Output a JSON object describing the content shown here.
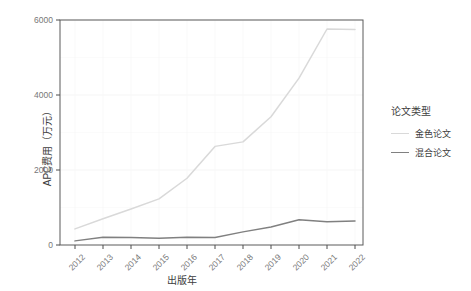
{
  "chart_data": {
    "type": "line",
    "title": "",
    "xlabel": "出版年",
    "ylabel": "APC费用（万元）",
    "x": [
      2012,
      2013,
      2014,
      2015,
      2016,
      2017,
      2018,
      2019,
      2020,
      2021,
      2022
    ],
    "xticklabels": [
      "2012",
      "2013",
      "2014",
      "2015",
      "2016",
      "2017",
      "2018",
      "2019",
      "2020",
      "2021",
      "2022"
    ],
    "yticklabels": [
      "0",
      "2000",
      "4000",
      "6000"
    ],
    "yticks": [
      0,
      2000,
      4000,
      6000
    ],
    "ylim": [
      0,
      6000
    ],
    "xlim": [
      2012,
      2022
    ],
    "grid": true,
    "legend_position": "right",
    "legend_title": "论文类型",
    "series": [
      {
        "name": "金色论文",
        "color": "#d9d9d9",
        "values": [
          430,
          700,
          960,
          1230,
          1780,
          2630,
          2750,
          3420,
          4450,
          5760,
          5750
        ]
      },
      {
        "name": "混合论文",
        "color": "#808080",
        "values": [
          110,
          205,
          200,
          180,
          205,
          200,
          350,
          480,
          675,
          620,
          640
        ]
      }
    ]
  },
  "axes": {
    "y_title": "APC费用（万元）",
    "x_title": "出版年"
  },
  "legend": {
    "title": "论文类型",
    "items": [
      {
        "label": "金色论文",
        "color": "#d9d9d9"
      },
      {
        "label": "混合论文",
        "color": "#808080"
      }
    ]
  },
  "colors": {
    "panel_background": "#ffffff",
    "grid": "#f2f2f2",
    "axis_line": "#4d4d4d",
    "tick_text": "#777777",
    "title_text": "#3d3d3d"
  }
}
